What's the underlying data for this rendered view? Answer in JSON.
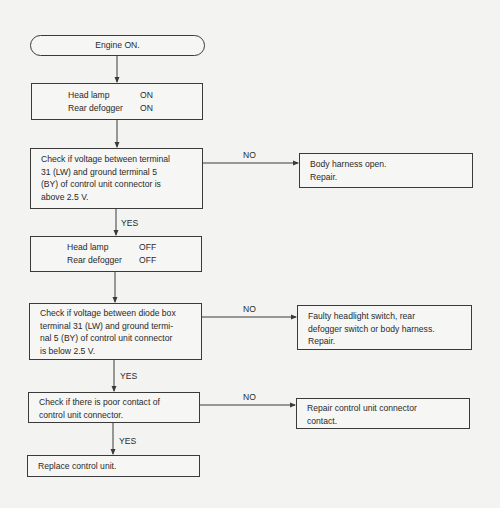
{
  "flowchart": {
    "start": {
      "label": "Engine ON."
    },
    "step_on": {
      "rows": [
        {
          "key": "Head lamp",
          "value": "ON"
        },
        {
          "key": "Rear defogger",
          "value": "ON"
        }
      ]
    },
    "check1": {
      "lines": [
        "Check if voltage between terminal",
        "31 (LW) and ground terminal 5",
        "(BY) of control unit connector is",
        "above 2.5 V."
      ],
      "no_label": "NO",
      "yes_label": "YES",
      "no_result": {
        "lines": [
          "Body harness open.",
          "Repair."
        ]
      }
    },
    "step_off": {
      "rows": [
        {
          "key": "Head lamp",
          "value": "OFF"
        },
        {
          "key": "Rear defogger",
          "value": "OFF"
        }
      ]
    },
    "check2": {
      "lines": [
        "Check if voltage between diode box",
        "terminal 31 (LW) and ground termi-",
        "nal 5 (BY) of control unit connector",
        "is below 2.5 V."
      ],
      "no_label": "NO",
      "yes_label": "YES",
      "no_result": {
        "lines": [
          "Faulty headlight switch, rear",
          "defogger switch or body harness.",
          "Repair."
        ]
      }
    },
    "check3": {
      "lines": [
        "Check if there is poor contact of",
        "control unit connector."
      ],
      "no_label": "NO",
      "yes_label": "YES",
      "no_result": {
        "lines": [
          "Repair control unit connector",
          "contact."
        ]
      }
    },
    "end": {
      "label": "Replace control unit."
    }
  },
  "colors": {
    "background": "#f3f3f1",
    "line": "#3a3a3a",
    "text": "#2a2a2a"
  }
}
